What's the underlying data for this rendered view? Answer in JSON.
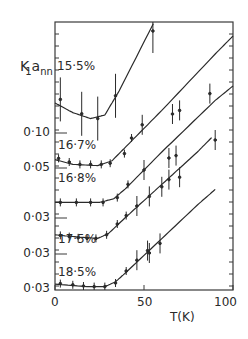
{
  "chart_data": {
    "type": "line",
    "title": "",
    "xlabel": "T(K)",
    "ylabel": "K₁a_nn",
    "ylabel_parts": {
      "main": "K",
      "sub": "1",
      "tail": "a",
      "tail_sub": "nn"
    },
    "xlim": [
      0,
      100
    ],
    "x_ticks": [
      0,
      50,
      100
    ],
    "x_tick_labels": [
      "0",
      "50",
      "100"
    ],
    "y_tick_labels": [
      "0·10",
      "0·05",
      "0·03",
      "0·03",
      "0·03"
    ],
    "y_tick_note": "Curves are vertically offset; each labelled tick marks a baseline for a stacked curve",
    "grid": false,
    "legend_position": "inline labels",
    "series": [
      {
        "name": "15·5%",
        "points": [
          [
            3,
            0.128
          ],
          [
            15,
            0.116
          ],
          [
            24,
            0.112
          ],
          [
            34,
            0.131
          ],
          [
            55,
            0.185
          ]
        ],
        "fit": [
          [
            0,
            0.125
          ],
          [
            10,
            0.117
          ],
          [
            20,
            0.112
          ],
          [
            28,
            0.115
          ],
          [
            36,
            0.135
          ],
          [
            60,
            0.205
          ],
          [
            78,
            0.258
          ]
        ]
      },
      {
        "name": "16·7%",
        "points": [
          [
            2,
            0.058
          ],
          [
            8,
            0.055
          ],
          [
            14,
            0.053
          ],
          [
            20,
            0.053
          ],
          [
            26,
            0.053
          ],
          [
            31,
            0.054
          ],
          [
            39,
            0.062
          ],
          [
            43,
            0.075
          ],
          [
            49,
            0.086
          ],
          [
            66,
            0.095
          ],
          [
            70,
            0.098
          ],
          [
            87,
            0.112
          ]
        ],
        "fit": [
          [
            0,
            0.057
          ],
          [
            10,
            0.053
          ],
          [
            24,
            0.052
          ],
          [
            32,
            0.056
          ],
          [
            40,
            0.068
          ],
          [
            60,
            0.098
          ],
          [
            90,
            0.145
          ],
          [
            100,
            0.16
          ]
        ]
      },
      {
        "name": "16·8%",
        "points": [
          [
            3,
            0.043
          ],
          [
            12,
            0.043
          ],
          [
            20,
            0.043
          ],
          [
            27,
            0.043
          ],
          [
            35,
            0.047
          ],
          [
            41,
            0.058
          ],
          [
            50,
            0.07
          ],
          [
            64,
            0.08
          ],
          [
            68,
            0.082
          ],
          [
            90,
            0.095
          ]
        ],
        "fit": [
          [
            0,
            0.043
          ],
          [
            25,
            0.043
          ],
          [
            33,
            0.046
          ],
          [
            40,
            0.055
          ],
          [
            60,
            0.085
          ],
          [
            90,
            0.128
          ],
          [
            100,
            0.14
          ]
        ]
      },
      {
        "name": "17·5%",
        "points": [
          [
            3,
            0.0155
          ],
          [
            8,
            0.0145
          ],
          [
            13,
            0.0135
          ],
          [
            18,
            0.013
          ],
          [
            23,
            0.013
          ],
          [
            29,
            0.016
          ],
          [
            35,
            0.025
          ],
          [
            40,
            0.032
          ],
          [
            46,
            0.04
          ],
          [
            53,
            0.048
          ],
          [
            60,
            0.056
          ],
          [
            64,
            0.062
          ],
          [
            70,
            0.064
          ]
        ],
        "fit": [
          [
            0,
            0.016
          ],
          [
            14,
            0.014
          ],
          [
            24,
            0.013
          ],
          [
            30,
            0.017
          ],
          [
            40,
            0.031
          ],
          [
            60,
            0.058
          ],
          [
            80,
            0.085
          ],
          [
            88,
            0.097
          ]
        ]
      },
      {
        "name": "18·5%",
        "points": [
          [
            3,
            0.0045
          ],
          [
            10,
            0.0035
          ],
          [
            16,
            0.0025
          ],
          [
            22,
            0.002
          ],
          [
            28,
            0.002
          ],
          [
            34,
            0.005
          ],
          [
            40,
            0.015
          ],
          [
            46,
            0.024
          ],
          [
            52,
            0.032
          ],
          [
            59,
            0.038
          ],
          [
            53,
            0.03
          ]
        ],
        "fit": [
          [
            0,
            0.004
          ],
          [
            18,
            0.002
          ],
          [
            28,
            0.002
          ],
          [
            34,
            0.006
          ],
          [
            40,
            0.014
          ],
          [
            60,
            0.042
          ],
          [
            80,
            0.07
          ],
          [
            90,
            0.083
          ]
        ]
      }
    ]
  },
  "labels": {
    "series_labels": [
      "15·5%",
      "16·7%",
      "16·8%",
      "17·5%",
      "18·5%"
    ],
    "y_ticks": [
      "0·10",
      "0·05",
      "0·03",
      "0·03",
      "0·03"
    ],
    "x_ticks": [
      "0",
      "50",
      "100"
    ],
    "x_title": "T(K)",
    "y_title_main": "K",
    "y_title_sub": "1",
    "y_title_tail": "a",
    "y_title_tail_sub": "nn"
  }
}
